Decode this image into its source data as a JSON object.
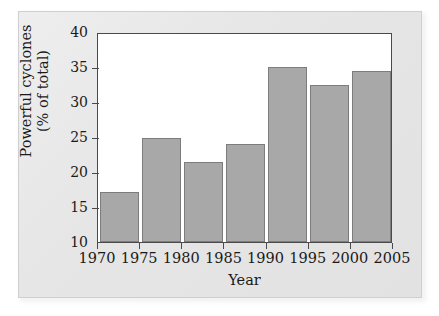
{
  "figure": {
    "background_color": "#e6e6e6",
    "plot_background_color": "#ffffff",
    "axis_color": "#4a4a4a",
    "bar_color": "#a8a8a8",
    "bar_border_color": "#7d7d7d"
  },
  "chart_data": {
    "type": "bar",
    "title": "",
    "xlabel": "Year",
    "ylabel": "Powerful cyclones (% of total)",
    "ylabel_line1": "Powerful cyclones",
    "ylabel_line2": "(% of total)",
    "categories": [
      "1970",
      "1975",
      "1980",
      "1985",
      "1990",
      "1995",
      "2000"
    ],
    "values": [
      17.2,
      24.8,
      21.4,
      24.0,
      35.0,
      32.4,
      34.5
    ],
    "bar_intervals": [
      {
        "start": "1970",
        "end": "1975",
        "value": 17.2
      },
      {
        "start": "1975",
        "end": "1980",
        "value": 24.8
      },
      {
        "start": "1980",
        "end": "1985",
        "value": 21.4
      },
      {
        "start": "1985",
        "end": "1990",
        "value": 24.0
      },
      {
        "start": "1990",
        "end": "1995",
        "value": 35.0
      },
      {
        "start": "1995",
        "end": "2000",
        "value": 32.4
      },
      {
        "start": "2000",
        "end": "2005",
        "value": 34.5
      }
    ],
    "xlim": [
      1970,
      2005
    ],
    "ylim": [
      10,
      40
    ],
    "xticks": [
      "1970",
      "1975",
      "1980",
      "1985",
      "1990",
      "1995",
      "2000",
      "2005"
    ],
    "yticks": [
      "10",
      "15",
      "20",
      "25",
      "30",
      "35",
      "40"
    ],
    "grid": false,
    "legend": null,
    "legend_position": "none"
  }
}
